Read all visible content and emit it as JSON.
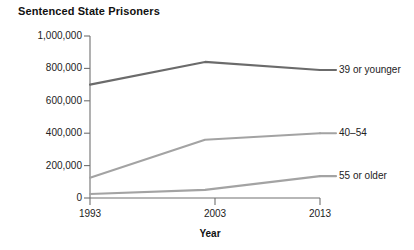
{
  "chart_data": {
    "type": "line",
    "title": "Sentenced State Prisoners",
    "xlabel": "Year",
    "ylabel": "",
    "x": [
      1993,
      2003,
      2013
    ],
    "xticklabels": [
      "1993",
      "2003",
      "2013"
    ],
    "yticklabels": [
      "0",
      "200,000",
      "400,000",
      "600,000",
      "800,000",
      "1,000,000"
    ],
    "ytickvalues": [
      0,
      200000,
      400000,
      600000,
      800000,
      1000000
    ],
    "ylim": [
      0,
      1000000
    ],
    "xlim": [
      1993,
      2013
    ],
    "grid": false,
    "legend_position": "right-of-line-ends",
    "series": [
      {
        "name": "39 or younger",
        "values": [
          700000,
          840000,
          790000
        ],
        "color": "#6b6b6b"
      },
      {
        "name": "40–54",
        "values": [
          125000,
          360000,
          400000
        ],
        "color": "#a3a3a3"
      },
      {
        "name": "55 or older",
        "values": [
          25000,
          50000,
          135000
        ],
        "color": "#a3a3a3"
      }
    ]
  },
  "axis": {
    "line_color": "#707070"
  }
}
